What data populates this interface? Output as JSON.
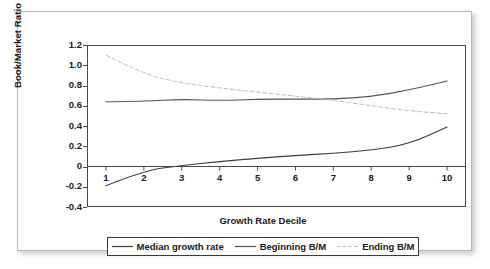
{
  "chart_data": {
    "type": "line",
    "title": "",
    "xlabel": "Growth Rate Decile",
    "ylabel": "Book/Market Ratio",
    "categories": [
      "1",
      "2",
      "3",
      "4",
      "5",
      "6",
      "7",
      "8",
      "9",
      "10"
    ],
    "x": [
      1,
      2,
      3,
      4,
      5,
      6,
      7,
      8,
      9,
      10
    ],
    "xlim": [
      0.5,
      10.5
    ],
    "ylim": [
      -0.4,
      1.2
    ],
    "yticks": [
      "1.2",
      "1.0",
      "0.8",
      "0.6",
      "0.4",
      "0.2",
      "0",
      "-0.2",
      "-0.4"
    ],
    "ytick_values": [
      1.2,
      1.0,
      0.8,
      0.6,
      0.4,
      0.2,
      0,
      -0.2,
      -0.4
    ],
    "grid": false,
    "zero_line": true,
    "legend_position": "bottom",
    "series": [
      {
        "name": "Median growth rate",
        "style": "solid",
        "color": "#3c3c3c",
        "values": [
          -0.19,
          -0.04,
          0.01,
          0.05,
          0.08,
          0.11,
          0.13,
          0.16,
          0.22,
          0.39
        ]
      },
      {
        "name": "Beginning B/M",
        "style": "solid",
        "color": "#555555",
        "values": [
          0.64,
          0.645,
          0.665,
          0.65,
          0.665,
          0.665,
          0.665,
          0.69,
          0.755,
          0.845
        ]
      },
      {
        "name": "Ending B/M",
        "style": "dashed",
        "color": "#bcbcbc",
        "values": [
          1.1,
          0.91,
          0.825,
          0.775,
          0.735,
          0.695,
          0.655,
          0.6,
          0.55,
          0.52
        ]
      }
    ]
  },
  "axis": {
    "y_title": "Book/Market Ratio",
    "x_title": "Growth Rate Decile"
  },
  "legend": {
    "items": [
      {
        "label": "Median growth rate",
        "style": "solid",
        "color": "#3c3c3c"
      },
      {
        "label": "Beginning B/M",
        "style": "solid",
        "color": "#555555"
      },
      {
        "label": "Ending B/M",
        "style": "dashed",
        "color": "#bcbcbc"
      }
    ]
  }
}
